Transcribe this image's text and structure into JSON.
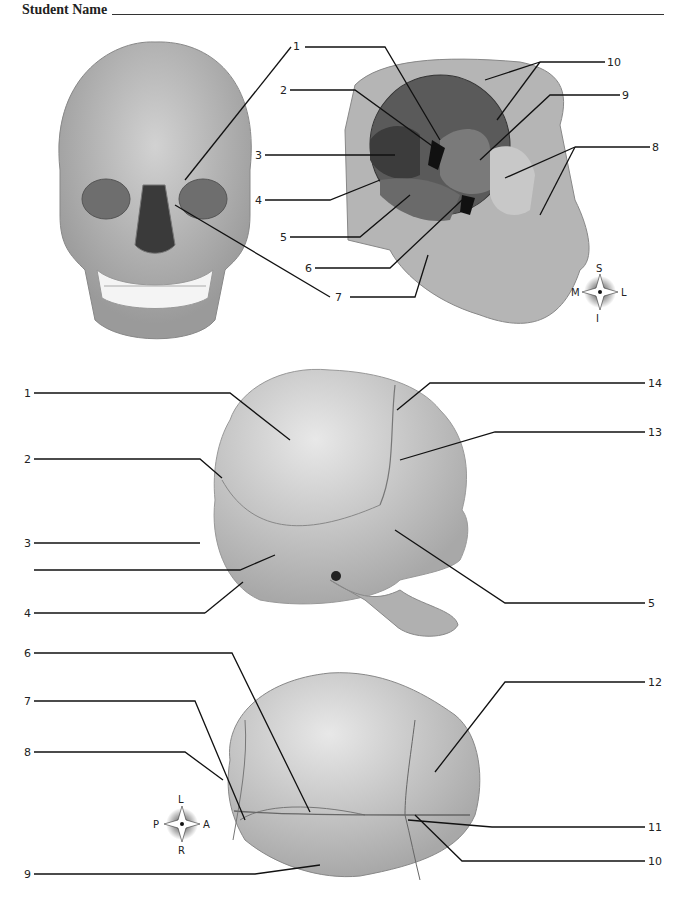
{
  "header": {
    "student_name_label": "Student Name"
  },
  "figures": {
    "anterior_skull": {
      "labels": [
        "1",
        "7"
      ]
    },
    "orbit": {
      "labels": [
        "1",
        "2",
        "3",
        "4",
        "5",
        "6",
        "7",
        "8",
        "9",
        "10"
      ],
      "compass": {
        "top": "S",
        "bottom": "I",
        "left": "M",
        "right": "L"
      }
    },
    "fetal_skull_lateral": {
      "labels": [
        "1",
        "2",
        "3",
        "4",
        "5",
        "13",
        "14"
      ]
    },
    "fetal_skull_superior": {
      "labels": [
        "6",
        "7",
        "8",
        "9",
        "10",
        "11",
        "12"
      ],
      "compass": {
        "top": "L",
        "bottom": "R",
        "left": "P",
        "right": "A"
      }
    }
  }
}
